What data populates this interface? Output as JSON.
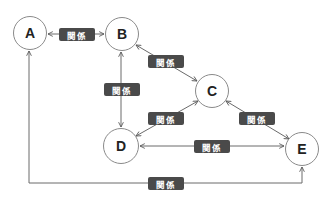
{
  "diagram": {
    "type": "relationship-graph",
    "colors": {
      "background": "#ffffff",
      "node_border": "#8a8a8a",
      "node_text": "#222222",
      "edge_line": "#6a6a6a",
      "label_bg": "#4a4a4a",
      "label_text": "#ffffff"
    },
    "nodes": [
      {
        "id": "A",
        "label": "A",
        "cx": 30,
        "cy": 33,
        "r": 17
      },
      {
        "id": "B",
        "label": "B",
        "cx": 122,
        "cy": 34,
        "r": 17
      },
      {
        "id": "C",
        "label": "C",
        "cx": 212,
        "cy": 91,
        "r": 17
      },
      {
        "id": "D",
        "label": "D",
        "cx": 121,
        "cy": 146,
        "r": 18
      },
      {
        "id": "E",
        "label": "E",
        "cx": 302,
        "cy": 149,
        "r": 17
      }
    ],
    "edges": [
      {
        "from": "A",
        "to": "B",
        "label": "関係",
        "direction": "both",
        "label_x": 59,
        "label_y": 28
      },
      {
        "from": "B",
        "to": "C",
        "label": "関係",
        "direction": "both",
        "label_x": 148,
        "label_y": 55
      },
      {
        "from": "B",
        "to": "D",
        "label": "関係",
        "direction": "both",
        "label_x": 104,
        "label_y": 83
      },
      {
        "from": "C",
        "to": "D",
        "label": "関係",
        "direction": "both",
        "label_x": 148,
        "label_y": 112
      },
      {
        "from": "C",
        "to": "E",
        "label": "関係",
        "direction": "both",
        "label_x": 239,
        "label_y": 112
      },
      {
        "from": "D",
        "to": "E",
        "label": "関係",
        "direction": "both",
        "label_x": 194,
        "label_y": 140
      },
      {
        "from": "E",
        "to": "A",
        "label": "関係",
        "direction": "both",
        "label_x": 148,
        "label_y": 177
      }
    ]
  }
}
